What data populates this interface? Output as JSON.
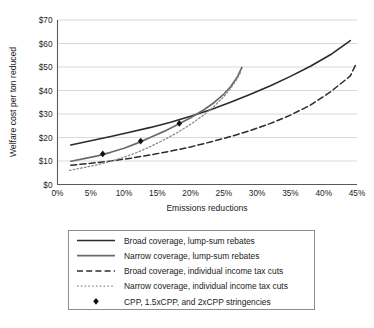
{
  "chart_data": {
    "type": "line",
    "title": "",
    "xlabel": "Emissions reductions",
    "ylabel": "Welfare cost per ton reduced",
    "xlim": [
      0,
      45
    ],
    "ylim": [
      0,
      70
    ],
    "grid": true,
    "x_tick_labels": [
      "0%",
      "5%",
      "10%",
      "15%",
      "20%",
      "25%",
      "30%",
      "35%",
      "40%",
      "45%"
    ],
    "x_tick_values": [
      0,
      5,
      10,
      15,
      20,
      25,
      30,
      35,
      40,
      45
    ],
    "y_tick_labels": [
      "$0",
      "$10",
      "$20",
      "$30",
      "$40",
      "$50",
      "$60",
      "$70"
    ],
    "y_tick_values": [
      0,
      10,
      20,
      30,
      40,
      50,
      60,
      70
    ],
    "legend_position": "below-center",
    "series": [
      {
        "name": "Broad coverage, lump-sum rebates",
        "style": "solid",
        "color": "#2b2b2b",
        "width": 1.6,
        "points": [
          [
            2.0,
            16.8
          ],
          [
            5.0,
            18.6
          ],
          [
            8.0,
            20.4
          ],
          [
            11.0,
            22.3
          ],
          [
            14.0,
            24.3
          ],
          [
            17.0,
            26.5
          ],
          [
            20.0,
            29.0
          ],
          [
            23.0,
            31.8
          ],
          [
            26.0,
            35.0
          ],
          [
            29.0,
            38.4
          ],
          [
            32.0,
            42.0
          ],
          [
            35.0,
            46.0
          ],
          [
            38.0,
            50.3
          ],
          [
            41.0,
            55.2
          ],
          [
            44.0,
            61.2
          ]
        ]
      },
      {
        "name": "Narrow coverage, lump-sum rebates",
        "style": "solid",
        "color": "#6b6b6b",
        "width": 1.7,
        "points": [
          [
            2.0,
            9.9
          ],
          [
            4.0,
            11.0
          ],
          [
            6.0,
            12.2
          ],
          [
            8.0,
            13.7
          ],
          [
            10.0,
            15.4
          ],
          [
            12.0,
            17.6
          ],
          [
            14.0,
            20.1
          ],
          [
            16.0,
            22.6
          ],
          [
            18.0,
            25.4
          ],
          [
            20.0,
            28.4
          ],
          [
            22.0,
            31.8
          ],
          [
            23.5,
            34.8
          ],
          [
            25.0,
            38.5
          ],
          [
            26.0,
            41.6
          ],
          [
            27.0,
            45.6
          ],
          [
            27.7,
            49.8
          ]
        ]
      },
      {
        "name": "Broad coverage, individual income tax cuts",
        "style": "dashed",
        "color": "#2b2b2b",
        "width": 1.5,
        "points": [
          [
            2.0,
            8.2
          ],
          [
            5.0,
            9.0
          ],
          [
            8.0,
            10.0
          ],
          [
            11.0,
            11.2
          ],
          [
            14.0,
            12.6
          ],
          [
            17.0,
            14.2
          ],
          [
            20.0,
            16.0
          ],
          [
            23.0,
            18.1
          ],
          [
            26.0,
            20.4
          ],
          [
            29.0,
            23.0
          ],
          [
            32.0,
            26.0
          ],
          [
            35.0,
            29.5
          ],
          [
            38.0,
            33.8
          ],
          [
            41.0,
            39.4
          ],
          [
            44.0,
            46.2
          ],
          [
            44.8,
            51.0
          ]
        ]
      },
      {
        "name": "Narrow coverage, individual income tax cuts",
        "style": "dotted",
        "color": "#8a8a8a",
        "width": 1.3,
        "points": [
          [
            1.8,
            6.0
          ],
          [
            4.0,
            7.2
          ],
          [
            6.0,
            8.4
          ],
          [
            8.0,
            9.9
          ],
          [
            10.0,
            11.6
          ],
          [
            12.0,
            13.7
          ],
          [
            14.0,
            16.2
          ],
          [
            16.0,
            19.0
          ],
          [
            18.0,
            22.1
          ],
          [
            20.0,
            25.6
          ],
          [
            22.0,
            29.6
          ],
          [
            23.5,
            33.2
          ],
          [
            25.0,
            37.4
          ],
          [
            26.0,
            40.8
          ],
          [
            27.0,
            45.0
          ],
          [
            27.6,
            48.2
          ]
        ]
      }
    ],
    "markers": {
      "name": "CPP, 1.5xCPP, and 2xCPP stringencies",
      "symbol": "diamond",
      "color": "#111111",
      "points": [
        [
          6.8,
          13.0
        ],
        [
          12.5,
          18.5
        ],
        [
          18.3,
          26.0
        ]
      ]
    }
  },
  "legend": {
    "entries": [
      {
        "label": "Broad coverage, lump-sum rebates",
        "swatch": "solid-dark-line"
      },
      {
        "label": "Narrow coverage, lump-sum rebates",
        "swatch": "solid-gray-line"
      },
      {
        "label": "Broad coverage, individual income tax cuts",
        "swatch": "dashed-dark-line"
      },
      {
        "label": "Narrow coverage, individual income tax cuts",
        "swatch": "dotted-gray-line"
      },
      {
        "label": "CPP, 1.5xCPP, and 2xCPP stringencies",
        "swatch": "diamond-marker"
      }
    ]
  }
}
